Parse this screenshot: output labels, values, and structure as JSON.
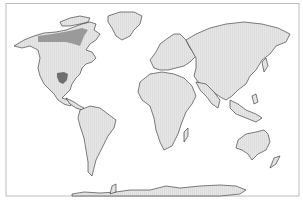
{
  "map": {
    "type": "world-distribution-map",
    "projection": "equirectangular-like",
    "colors": {
      "background": "#ffffff",
      "frame": "#bdbdbd",
      "land_fill": "#e6e6e6",
      "land_hatch": "#cfcfcf",
      "coastline": "#2a2a2a",
      "range_primary": "#6f6f6f",
      "range_secondary": "#9a9a9a"
    },
    "highlighted_regions": [
      {
        "name": "Canadian boreal band",
        "shade": "range_secondary"
      },
      {
        "name": "South-central United States",
        "shade": "range_primary"
      }
    ],
    "continents": [
      "North America",
      "Greenland",
      "South America",
      "Europe",
      "Africa",
      "Asia",
      "Australia",
      "Antarctica"
    ]
  }
}
